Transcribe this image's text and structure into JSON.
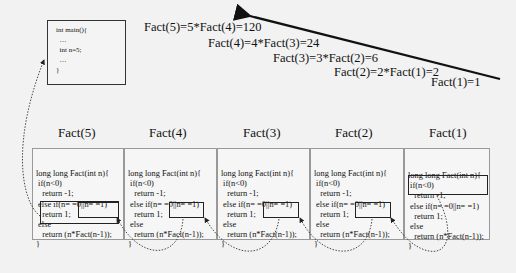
{
  "main_box": {
    "lines": [
      "int main(){",
      "  …",
      "  int n=5;",
      "  …",
      "}"
    ]
  },
  "equations": [
    "Fact(5)=5*Fact(4)=120",
    "Fact(4)=4*Fact(3)=24",
    "Fact(3)=3*Fact(2)=6",
    "Fact(2)=2*Fact(1)=2",
    "Fact(1)=1"
  ],
  "frames": [
    {
      "title": "Fact(5)",
      "lines": [
        "long long Fact(int n){",
        " if(n<0)",
        "   return -1;",
        " else if(n= =0||n= =1)",
        "   return 1;",
        " else",
        "   return (n*Fact(n-1));",
        "}"
      ]
    },
    {
      "title": "Fact(4)",
      "lines": [
        "long long Fact(int n){",
        " if(n<0)",
        "   return -1;",
        " else if(n= =0||n= =1)",
        "   return 1;",
        " else",
        "   return (n*Fact(n-1));",
        "}"
      ]
    },
    {
      "title": "Fact(3)",
      "lines": [
        "long long Fact(int n){",
        " if(n<0)",
        "   return -1;",
        " else if(n= =0||n= =1)",
        "   return 1;",
        " else",
        "   return (n*Fact(n-1));",
        "}"
      ]
    },
    {
      "title": "Fact(2)",
      "lines": [
        "long long Fact(int n){",
        " if(n<0)",
        "   return -1;",
        " else if(n= =0||n= =1)",
        "   return 1;",
        " else",
        "   return (n*Fact(n-1));",
        "}"
      ]
    },
    {
      "title": "Fact(1)",
      "lines": [
        "long long Fact(int n){",
        " if(n<0)",
        "   return -1;",
        " else if(n= =0||n= =1)",
        "   return 1;",
        " else",
        "   return (n*Fact(n-1));",
        "}"
      ]
    }
  ],
  "colors": {
    "background": "#f2f2f2",
    "line": "#111111",
    "box_border": "#999999"
  }
}
